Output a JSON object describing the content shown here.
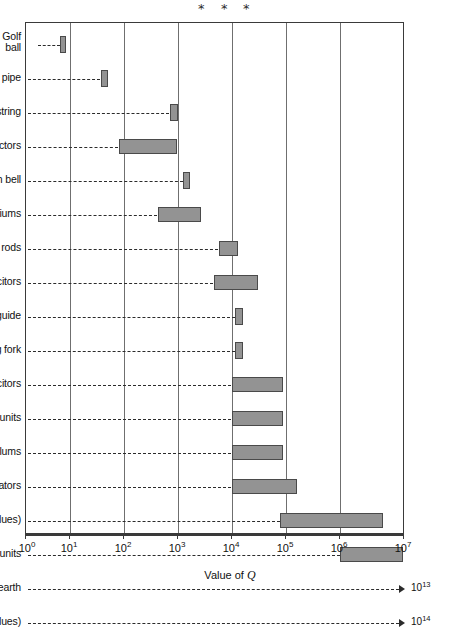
{
  "chart_data": {
    "type": "bar",
    "orientation": "horizontal",
    "title": "",
    "xlabel": "Value of Q",
    "ylabel": "",
    "xscale": "log",
    "xlim": [
      1,
      10000000
    ],
    "grid": true,
    "legend": null,
    "xticks": [
      {
        "label": "10",
        "exp": "0",
        "value": 1
      },
      {
        "label": "10",
        "exp": "1",
        "value": 10
      },
      {
        "label": "10",
        "exp": "2",
        "value": 100
      },
      {
        "label": "10",
        "exp": "3",
        "value": 1000
      },
      {
        "label": "10",
        "exp": "4",
        "value": 10000
      },
      {
        "label": "10",
        "exp": "5",
        "value": 100000
      },
      {
        "label": "10",
        "exp": "6",
        "value": 1000000
      },
      {
        "label": "10",
        "exp": "7",
        "value": 10000000
      }
    ],
    "categories": [
      "Golf ball",
      "Organ pipe",
      "Piano string",
      "Inductors",
      "Church bell",
      "Auditoriums",
      "Magnetostrictive rods",
      "Mica capacitors",
      "Wave guide",
      "Tuning fork",
      "Air capacitors",
      "Commercial quartz-crystal units",
      "Pendulums",
      "Cavity resonators",
      "Spectral lines (practical values)",
      "Precision quartz-crystal units",
      "Planet earth",
      "Spectral lines (inherent values)"
    ],
    "ranges": [
      {
        "category": "Golf ball",
        "low": 5,
        "high": 9,
        "offscale": false
      },
      {
        "category": "Organ pipe",
        "low": 48,
        "high": 80,
        "offscale": false
      },
      {
        "category": "Piano string",
        "low": 650,
        "high": 1000,
        "offscale": false
      },
      {
        "category": "Inductors",
        "low": 55,
        "high": 750,
        "offscale": false
      },
      {
        "category": "Church bell",
        "low": 1400,
        "high": 2000,
        "offscale": false
      },
      {
        "category": "Auditoriums",
        "low": 500,
        "high": 3000,
        "offscale": false
      },
      {
        "category": "Magnetostrictive rods",
        "low": 4500,
        "high": 10000,
        "offscale": false
      },
      {
        "category": "Mica capacitors",
        "low": 4000,
        "high": 25000,
        "offscale": false
      },
      {
        "category": "Wave guide",
        "low": 11000,
        "high": 16000,
        "offscale": false
      },
      {
        "category": "Tuning fork",
        "low": 11000,
        "high": 16000,
        "offscale": false
      },
      {
        "category": "Air capacitors",
        "low": 10000,
        "high": 90000,
        "offscale": false
      },
      {
        "category": "Commercial quartz-crystal units",
        "low": 10000,
        "high": 90000,
        "offscale": false
      },
      {
        "category": "Pendulums",
        "low": 10000,
        "high": 90000,
        "offscale": false
      },
      {
        "category": "Cavity resonators",
        "low": 10000,
        "high": 160000,
        "offscale": false
      },
      {
        "category": "Spectral lines (practical values)",
        "low": 80000,
        "high": 4500000,
        "offscale": false
      },
      {
        "category": "Precision quartz-crystal units",
        "low": 1000000,
        "high": 10000000,
        "offscale": false
      },
      {
        "category": "Planet earth",
        "low": null,
        "high": null,
        "offscale": true,
        "arrow_label": "10",
        "arrow_exp": "13"
      },
      {
        "category": "Spectral lines (inherent values)",
        "low": null,
        "high": null,
        "offscale": true,
        "arrow_label": "10",
        "arrow_exp": "14"
      }
    ],
    "annotations": [
      {
        "name": "asterisk-1",
        "symbol": "*"
      },
      {
        "name": "asterisk-2",
        "symbol": "*"
      },
      {
        "name": "asterisk-3",
        "symbol": "*"
      }
    ]
  }
}
